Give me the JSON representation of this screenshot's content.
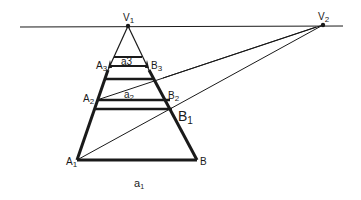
{
  "diagram": {
    "type": "two-point perspective construction",
    "labels": {
      "v1": "V",
      "v1_sub": "1",
      "v2": "V",
      "v2_sub": "2",
      "a3": "A",
      "a3_sub": "3",
      "b3": "B",
      "b3_sub": "3",
      "seg_a3": "a3",
      "a2": "A",
      "a2_sub": "2",
      "b2": "B",
      "b2_sub": "2",
      "seg_a2": "a",
      "seg_a2_sub": "2",
      "b1": "B",
      "b1_sub": "1",
      "a1": "A",
      "a1_sub": "1",
      "b": "B",
      "caption": "a",
      "caption_sub": "1"
    },
    "colors": {
      "stroke": "#1a1a1a",
      "background": "#ffffff"
    }
  }
}
